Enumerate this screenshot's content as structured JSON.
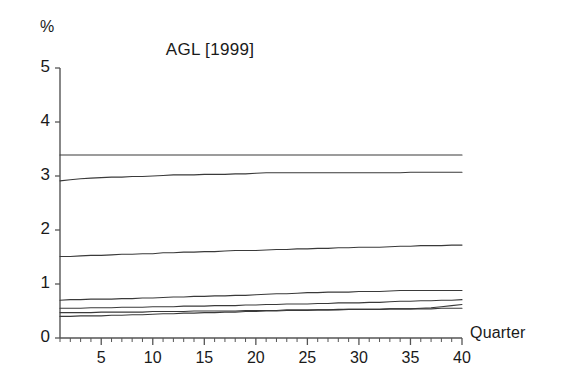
{
  "chart_data": {
    "type": "line",
    "title": "AGL [1999]",
    "xlabel": "Quarter",
    "ylabel": "%",
    "xlim": [
      1,
      40
    ],
    "ylim": [
      0,
      5
    ],
    "grid": false,
    "legend": null,
    "ytick_labels": [
      "0",
      "1",
      "2",
      "3",
      "4",
      "5"
    ],
    "ytick_values": [
      0,
      1,
      2,
      3,
      4,
      5
    ],
    "xtick_labels": [
      "5",
      "10",
      "15",
      "20",
      "25",
      "30",
      "35",
      "40"
    ],
    "xtick_values": [
      5,
      10,
      15,
      20,
      25,
      30,
      35,
      40
    ],
    "x": [
      1,
      2,
      3,
      4,
      5,
      6,
      7,
      8,
      9,
      10,
      11,
      12,
      13,
      14,
      15,
      16,
      17,
      18,
      19,
      20,
      21,
      22,
      23,
      24,
      25,
      26,
      27,
      28,
      29,
      30,
      31,
      32,
      33,
      34,
      35,
      36,
      37,
      38,
      39,
      40
    ],
    "series": [
      {
        "name": "series-1",
        "values": [
          3.39,
          3.39,
          3.39,
          3.39,
          3.39,
          3.39,
          3.39,
          3.39,
          3.39,
          3.39,
          3.39,
          3.39,
          3.39,
          3.39,
          3.39,
          3.39,
          3.39,
          3.39,
          3.39,
          3.39,
          3.39,
          3.39,
          3.39,
          3.39,
          3.39,
          3.39,
          3.39,
          3.39,
          3.39,
          3.39,
          3.39,
          3.39,
          3.39,
          3.39,
          3.39,
          3.39,
          3.39,
          3.39,
          3.39,
          3.39
        ]
      },
      {
        "name": "series-2",
        "values": [
          2.91,
          2.93,
          2.95,
          2.96,
          2.97,
          2.98,
          2.98,
          2.99,
          2.99,
          3.0,
          3.01,
          3.02,
          3.02,
          3.02,
          3.03,
          3.03,
          3.03,
          3.04,
          3.04,
          3.05,
          3.06,
          3.06,
          3.06,
          3.06,
          3.06,
          3.06,
          3.06,
          3.06,
          3.06,
          3.06,
          3.06,
          3.06,
          3.06,
          3.06,
          3.07,
          3.07,
          3.07,
          3.07,
          3.07,
          3.07
        ]
      },
      {
        "name": "series-3",
        "values": [
          1.51,
          1.51,
          1.52,
          1.53,
          1.53,
          1.54,
          1.55,
          1.55,
          1.56,
          1.56,
          1.58,
          1.58,
          1.59,
          1.59,
          1.6,
          1.6,
          1.61,
          1.62,
          1.62,
          1.62,
          1.63,
          1.64,
          1.64,
          1.65,
          1.65,
          1.66,
          1.66,
          1.67,
          1.67,
          1.68,
          1.68,
          1.68,
          1.69,
          1.7,
          1.7,
          1.71,
          1.71,
          1.71,
          1.72,
          1.72
        ]
      },
      {
        "name": "series-4",
        "values": [
          0.7,
          0.71,
          0.71,
          0.72,
          0.72,
          0.72,
          0.73,
          0.73,
          0.74,
          0.74,
          0.75,
          0.76,
          0.76,
          0.77,
          0.77,
          0.78,
          0.78,
          0.79,
          0.79,
          0.8,
          0.81,
          0.82,
          0.82,
          0.83,
          0.84,
          0.84,
          0.85,
          0.85,
          0.85,
          0.86,
          0.86,
          0.86,
          0.87,
          0.88,
          0.88,
          0.88,
          0.88,
          0.88,
          0.88,
          0.88
        ]
      },
      {
        "name": "series-5",
        "values": [
          0.55,
          0.55,
          0.55,
          0.56,
          0.56,
          0.56,
          0.57,
          0.57,
          0.57,
          0.58,
          0.58,
          0.58,
          0.59,
          0.59,
          0.59,
          0.6,
          0.6,
          0.6,
          0.61,
          0.61,
          0.62,
          0.62,
          0.63,
          0.63,
          0.63,
          0.64,
          0.64,
          0.65,
          0.65,
          0.65,
          0.66,
          0.66,
          0.67,
          0.68,
          0.68,
          0.69,
          0.69,
          0.7,
          0.7,
          0.71
        ]
      },
      {
        "name": "series-6",
        "values": [
          0.47,
          0.47,
          0.47,
          0.47,
          0.48,
          0.48,
          0.48,
          0.48,
          0.48,
          0.49,
          0.49,
          0.49,
          0.49,
          0.5,
          0.5,
          0.5,
          0.5,
          0.5,
          0.51,
          0.51,
          0.51,
          0.51,
          0.52,
          0.52,
          0.52,
          0.52,
          0.52,
          0.53,
          0.53,
          0.53,
          0.53,
          0.53,
          0.54,
          0.54,
          0.54,
          0.54,
          0.54,
          0.55,
          0.55,
          0.55
        ]
      },
      {
        "name": "series-7",
        "values": [
          0.4,
          0.4,
          0.41,
          0.41,
          0.41,
          0.42,
          0.42,
          0.43,
          0.43,
          0.44,
          0.45,
          0.45,
          0.46,
          0.46,
          0.47,
          0.47,
          0.48,
          0.48,
          0.49,
          0.49,
          0.5,
          0.5,
          0.51,
          0.51,
          0.51,
          0.52,
          0.52,
          0.52,
          0.53,
          0.53,
          0.53,
          0.53,
          0.54,
          0.54,
          0.54,
          0.55,
          0.56,
          0.58,
          0.6,
          0.62
        ]
      }
    ]
  },
  "axes": {
    "line_color": "#555555",
    "text_color": "#1a1a1a",
    "background": "#ffffff"
  }
}
